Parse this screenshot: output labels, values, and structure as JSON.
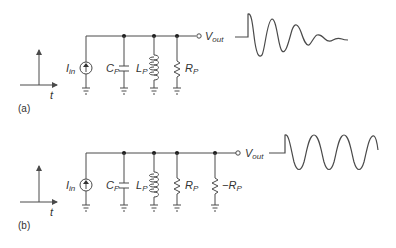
{
  "figure": {
    "panels": [
      {
        "id": "a",
        "label": "(a)",
        "input_graph": {
          "axis_label": "t",
          "signal": "impulse"
        },
        "circuit": {
          "source": {
            "name": "I",
            "sub": "in"
          },
          "components": [
            {
              "type": "capacitor",
              "name": "C",
              "sub": "P"
            },
            {
              "type": "inductor",
              "name": "L",
              "sub": "P"
            },
            {
              "type": "resistor",
              "name": "R",
              "sub": "P"
            }
          ],
          "output": {
            "name": "V",
            "sub": "out"
          }
        },
        "output_waveform": "damped oscillation"
      },
      {
        "id": "b",
        "label": "(b)",
        "input_graph": {
          "axis_label": "t",
          "signal": "impulse"
        },
        "circuit": {
          "source": {
            "name": "I",
            "sub": "in"
          },
          "components": [
            {
              "type": "capacitor",
              "name": "C",
              "sub": "P"
            },
            {
              "type": "inductor",
              "name": "L",
              "sub": "P"
            },
            {
              "type": "resistor",
              "name": "R",
              "sub": "P"
            },
            {
              "type": "resistor",
              "name": "−R",
              "sub": "P"
            }
          ],
          "output": {
            "name": "V",
            "sub": "out"
          }
        },
        "output_waveform": "sustained oscillation"
      }
    ],
    "colors": {
      "line": "#4a4a4a",
      "text": "#333333",
      "node": "#1a1a1a"
    }
  }
}
